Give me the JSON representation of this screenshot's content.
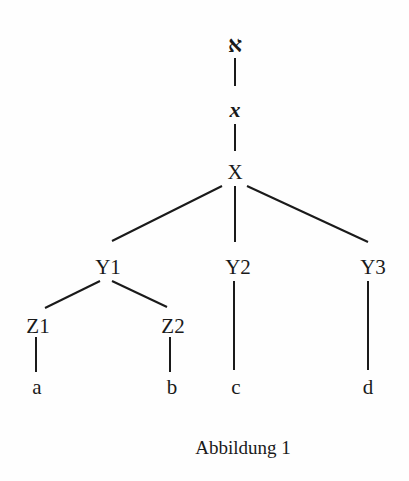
{
  "diagram": {
    "type": "tree",
    "colors": {
      "line": "#1a1a1a",
      "text": "#1a1a1a",
      "background": "#fefefe"
    },
    "nodes": {
      "aleph": "א",
      "chi": "x",
      "X": "X",
      "Y1": "Y1",
      "Y2": "Y2",
      "Y3": "Y3",
      "Z1": "Z1",
      "Z2": "Z2",
      "a": "a",
      "b": "b",
      "c": "c",
      "d": "d"
    },
    "edges": [
      [
        "aleph",
        "chi"
      ],
      [
        "chi",
        "X"
      ],
      [
        "X",
        "Y1"
      ],
      [
        "X",
        "Y2"
      ],
      [
        "X",
        "Y3"
      ],
      [
        "Y1",
        "Z1"
      ],
      [
        "Y1",
        "Z2"
      ],
      [
        "Z1",
        "a"
      ],
      [
        "Z2",
        "b"
      ],
      [
        "Y2",
        "c"
      ],
      [
        "Y3",
        "d"
      ]
    ],
    "caption": "Abbildung 1"
  }
}
